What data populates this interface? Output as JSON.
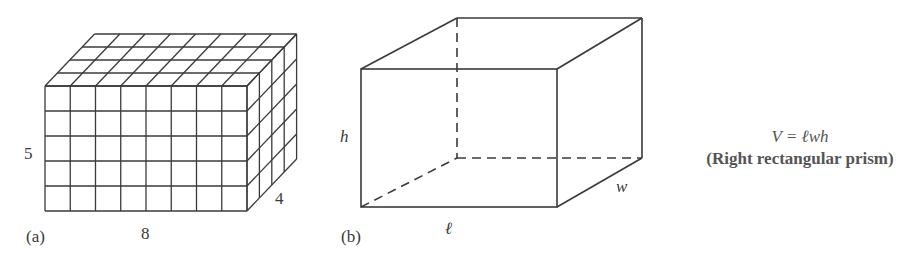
{
  "figure_a": {
    "label": "(a)",
    "length_label": "8",
    "height_label": "5",
    "depth_label": "4",
    "grid": {
      "length": 8,
      "height": 5,
      "depth": 4
    }
  },
  "figure_b": {
    "label": "(b)",
    "length_label": "ℓ",
    "height_label": "h",
    "width_label": "w"
  },
  "formula": {
    "equation": "V = ℓwh",
    "caption": "(Right rectangular prism)"
  },
  "colors": {
    "stroke": "#3a3a3a",
    "background": "#ffffff"
  }
}
